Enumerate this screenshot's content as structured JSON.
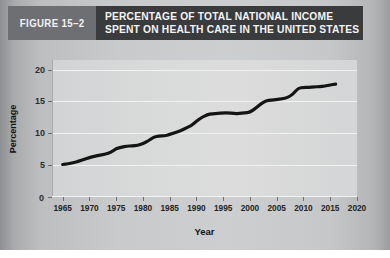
{
  "figure": {
    "badge": "FIGURE 15–2",
    "title_line1": "PERCENTAGE OF TOTAL NATIONAL INCOME",
    "title_line2": "SPENT ON HEALTH CARE IN THE UNITED STATES",
    "badge_bg": "#6e6f72",
    "titlebar_bg": "#3a3b3d",
    "title_color": "#f4f4f4"
  },
  "chart_data": {
    "type": "line",
    "title": "PERCENTAGE OF TOTAL NATIONAL INCOME SPENT ON HEALTH CARE IN THE UNITED STATES",
    "xlabel": "Year",
    "ylabel": "Percentage",
    "xlim": [
      1963,
      2020
    ],
    "ylim": [
      0,
      21.5
    ],
    "xticks": [
      1965,
      1970,
      1975,
      1980,
      1985,
      1990,
      1995,
      2000,
      2005,
      2010,
      2015,
      2020
    ],
    "yticks": [
      0,
      5,
      10,
      15,
      20
    ],
    "ytick_labels": [
      "0",
      "5",
      "10",
      "15",
      "20"
    ],
    "origin_label": "0",
    "grid": "horizontal",
    "legend": "none",
    "line_color": "#141414",
    "line_width_px": 3.2,
    "series": [
      {
        "name": "Health care share of national income",
        "x": [
          1965,
          1966,
          1967,
          1968,
          1969,
          1970,
          1971,
          1972,
          1973,
          1974,
          1975,
          1976,
          1977,
          1978,
          1979,
          1980,
          1981,
          1982,
          1983,
          1984,
          1985,
          1986,
          1987,
          1988,
          1989,
          1990,
          1991,
          1992,
          1993,
          1994,
          1995,
          1996,
          1997,
          1998,
          1999,
          2000,
          2001,
          2002,
          2003,
          2004,
          2005,
          2006,
          2007,
          2008,
          2009,
          2010,
          2011,
          2012,
          2013,
          2014,
          2015,
          2016
        ],
        "values": [
          5.1,
          5.2,
          5.4,
          5.6,
          5.9,
          6.2,
          6.4,
          6.6,
          6.7,
          7.0,
          7.6,
          7.8,
          8.0,
          8.0,
          8.1,
          8.4,
          8.8,
          9.4,
          9.6,
          9.6,
          9.8,
          10.1,
          10.4,
          10.8,
          11.2,
          11.9,
          12.5,
          12.9,
          13.1,
          13.1,
          13.2,
          13.2,
          13.1,
          13.1,
          13.2,
          13.3,
          13.9,
          14.6,
          15.1,
          15.2,
          15.3,
          15.4,
          15.6,
          16.1,
          17.1,
          17.2,
          17.2,
          17.3,
          17.3,
          17.4,
          17.6,
          17.7
        ]
      }
    ]
  }
}
